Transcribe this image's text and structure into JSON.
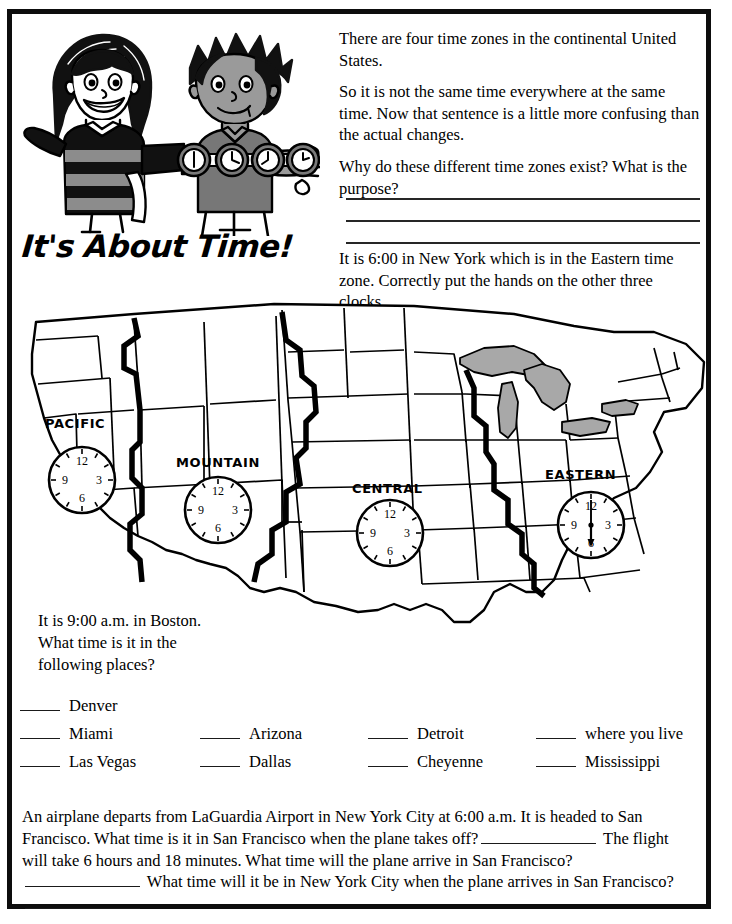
{
  "title": "It's About Time!",
  "intro": {
    "p1": "There are four time zones in the continental United States.",
    "p2": "So it is not the same time everywhere at the same time.  Now that sentence is a little more confusing than the actual changes.",
    "p3": "Why do these different time zones exist?  What is the purpose?",
    "answer_lines": 3
  },
  "newyork_note": "It is 6:00 in New York which is in the Eastern time zone.  Correctly put the hands on the other three clocks.",
  "map": {
    "zones": [
      {
        "label": "PACIFIC",
        "clock_hands": "none",
        "hour": null,
        "minute": null
      },
      {
        "label": "MOUNTAIN",
        "clock_hands": "none",
        "hour": null,
        "minute": null
      },
      {
        "label": "CENTRAL",
        "clock_hands": "none",
        "hour": null,
        "minute": null
      },
      {
        "label": "EASTERN",
        "clock_hands": "6:00",
        "hour": 6,
        "minute": 0
      }
    ],
    "clock_numerals": [
      "12",
      "3",
      "6",
      "9"
    ],
    "lakes_color": "#a8a8a8",
    "outline_color": "#000000"
  },
  "boston_question": {
    "line1": "It is 9:00 a.m. in Boston.",
    "line2": "What time is it in the",
    "line3": "following places?"
  },
  "blanks": {
    "rows": [
      [
        "Denver",
        "",
        "",
        ""
      ],
      [
        "Miami",
        "Arizona",
        "Detroit",
        "where you live"
      ],
      [
        "Las Vegas",
        "Dallas",
        "Cheyenne",
        "Mississippi"
      ]
    ]
  },
  "bottom_problem": {
    "seg1": "An airplane departs from LaGuardia Airport in New York City at 6:00 a.m.  It is headed to San Francisco.  What time is it in San Francisco when the plane takes off?",
    "seg2": "The flight will take 6 hours and 18 minutes.  What time will the plane arrive in San Francisco?",
    "seg3": "What time will it be in New York City when the plane arrives in San Francisco?"
  }
}
